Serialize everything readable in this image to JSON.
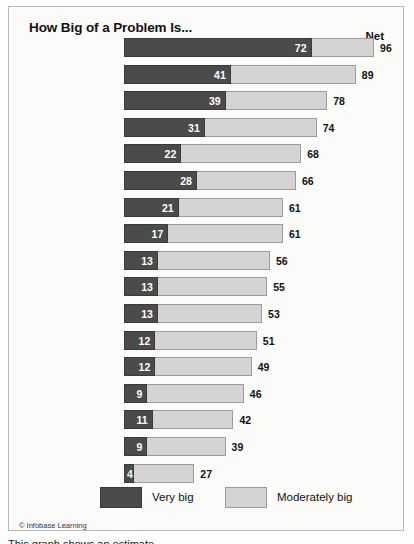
{
  "panel": {
    "title": "How Big of a Problem Is...",
    "net_header": "Net",
    "credit": "© Infobase Learning",
    "caption_cut": "This graph shows an estimate"
  },
  "legend": {
    "items": [
      {
        "label": "Very big",
        "color": "#4b4b4b",
        "swatch": "dark-swatch"
      },
      {
        "label": "Moderately big",
        "color": "#d4d4d4",
        "swatch": "light-swatch"
      }
    ]
  },
  "colors": {
    "very_big": "#4b4b4b",
    "moderately_big": "#d4d4d4",
    "panel_border": "#b9b9b9",
    "background": "#fbfbfa",
    "text": "#111111"
  },
  "chart_data": {
    "type": "bar",
    "orientation": "horizontal",
    "stacked": true,
    "title": "How Big of a Problem Is...",
    "xlabel": "",
    "ylabel": "",
    "xlim": [
      0,
      96
    ],
    "grid": false,
    "legend_position": "bottom",
    "value_column_header": "Net",
    "categories": [
      "Rising prices",
      "Rich/poor gap",
      "Corrupt officials",
      "Air pollution",
      "Unemployment",
      "Water pollution",
      "Corrupt businesspeople",
      "Crime",
      "Condition for workers",
      "Quality of manufactured goods",
      "Old age insurance",
      "Health care",
      "Safety of food",
      "Safety of medicine",
      "Education",
      "Traffic",
      "Electricity shortages"
    ],
    "series": [
      {
        "name": "Very big",
        "color": "#4b4b4b",
        "values": [
          72,
          41,
          39,
          31,
          22,
          28,
          21,
          17,
          13,
          13,
          13,
          12,
          12,
          9,
          11,
          9,
          4
        ]
      },
      {
        "name": "Net",
        "color": "#d4d4d4",
        "values": [
          96,
          89,
          78,
          74,
          68,
          66,
          61,
          61,
          56,
          55,
          53,
          51,
          49,
          46,
          42,
          39,
          27
        ]
      }
    ]
  },
  "rows": [
    {
      "label": "Rising prices",
      "label_lines": [
        "Rising prices"
      ],
      "very_big": 72,
      "net": 96
    },
    {
      "label": "Rich/poor gap",
      "label_lines": [
        "Rich/poor gap"
      ],
      "very_big": 41,
      "net": 89
    },
    {
      "label": "Corrupt officials",
      "label_lines": [
        "Corrupt officials"
      ],
      "very_big": 39,
      "net": 78
    },
    {
      "label": "Air pollution",
      "label_lines": [
        "Air pollution"
      ],
      "very_big": 31,
      "net": 74
    },
    {
      "label": "Unemployment",
      "label_lines": [
        "Unemployment"
      ],
      "very_big": 22,
      "net": 68
    },
    {
      "label": "Water pollution",
      "label_lines": [
        "Water pollution"
      ],
      "very_big": 28,
      "net": 66
    },
    {
      "label": "Corrupt businesspeople",
      "label_lines": [
        "Corrupt businesspeople"
      ],
      "very_big": 21,
      "net": 61
    },
    {
      "label": "Crime",
      "label_lines": [
        "Crime"
      ],
      "very_big": 17,
      "net": 61
    },
    {
      "label": "Condition for workers",
      "label_lines": [
        "Condition for workers"
      ],
      "very_big": 13,
      "net": 56
    },
    {
      "label": "Quality of manufactured goods",
      "label_lines": [
        "Quality of",
        "manufactured goods"
      ],
      "very_big": 13,
      "net": 55
    },
    {
      "label": "Old age insurance",
      "label_lines": [
        "Old age insurance"
      ],
      "very_big": 13,
      "net": 53
    },
    {
      "label": "Health care",
      "label_lines": [
        "Health care"
      ],
      "very_big": 12,
      "net": 51
    },
    {
      "label": "Safety of food",
      "label_lines": [
        "Safety of food"
      ],
      "very_big": 12,
      "net": 49
    },
    {
      "label": "Safety of medicine",
      "label_lines": [
        "Safety of medicine"
      ],
      "very_big": 9,
      "net": 46
    },
    {
      "label": "Education",
      "label_lines": [
        "Education"
      ],
      "very_big": 11,
      "net": 42
    },
    {
      "label": "Traffic",
      "label_lines": [
        "Traffic"
      ],
      "very_big": 9,
      "net": 39
    },
    {
      "label": "Electricity shortages",
      "label_lines": [
        "Electricity shortages"
      ],
      "very_big": 4,
      "net": 27
    }
  ]
}
